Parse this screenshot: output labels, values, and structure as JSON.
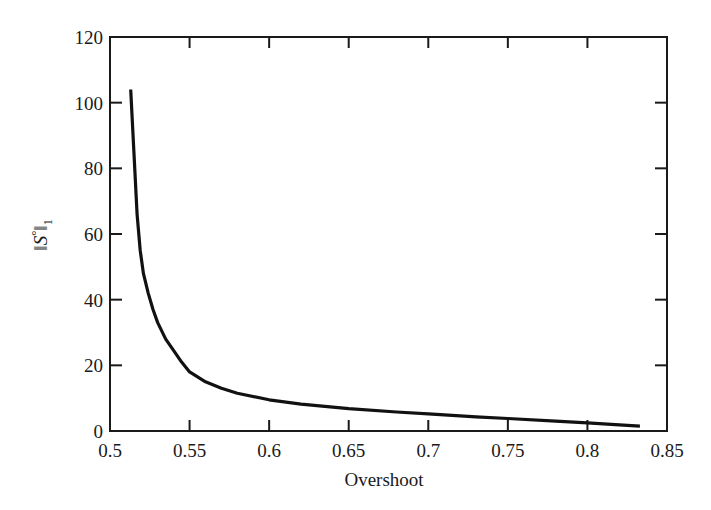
{
  "chart_data": {
    "type": "line",
    "title": "",
    "xlabel": "Overshoot",
    "ylabel": "‖S°‖₁",
    "ylabel_parts": {
      "norm_open": "‖",
      "symbol": "S",
      "superscript": "°",
      "norm_close": "‖",
      "subscript": "1"
    },
    "xlim": [
      0.5,
      0.85
    ],
    "ylim": [
      0,
      120
    ],
    "xticks": [
      0.5,
      0.55,
      0.6,
      0.65,
      0.7,
      0.75,
      0.8,
      0.85
    ],
    "xtick_labels": [
      "0.5",
      "0.55",
      "0.6",
      "0.65",
      "0.7",
      "0.75",
      "0.8",
      "0.85"
    ],
    "yticks": [
      0,
      20,
      40,
      60,
      80,
      100,
      120
    ],
    "ytick_labels": [
      "0",
      "20",
      "40",
      "60",
      "80",
      "100",
      "120"
    ],
    "grid": false,
    "legend": null,
    "series": [
      {
        "name": "‖S°‖₁ vs overshoot",
        "color": "#111111",
        "x": [
          0.513,
          0.515,
          0.517,
          0.519,
          0.521,
          0.524,
          0.527,
          0.53,
          0.535,
          0.54,
          0.545,
          0.55,
          0.56,
          0.57,
          0.58,
          0.6,
          0.62,
          0.65,
          0.68,
          0.7,
          0.73,
          0.75,
          0.78,
          0.8,
          0.82,
          0.833
        ],
        "y": [
          104,
          85,
          66,
          55,
          48,
          42,
          37,
          33,
          28,
          24.5,
          21,
          18,
          15,
          13,
          11.5,
          9.5,
          8.2,
          6.8,
          5.8,
          5.2,
          4.3,
          3.8,
          3.0,
          2.5,
          1.9,
          1.5
        ]
      }
    ]
  }
}
